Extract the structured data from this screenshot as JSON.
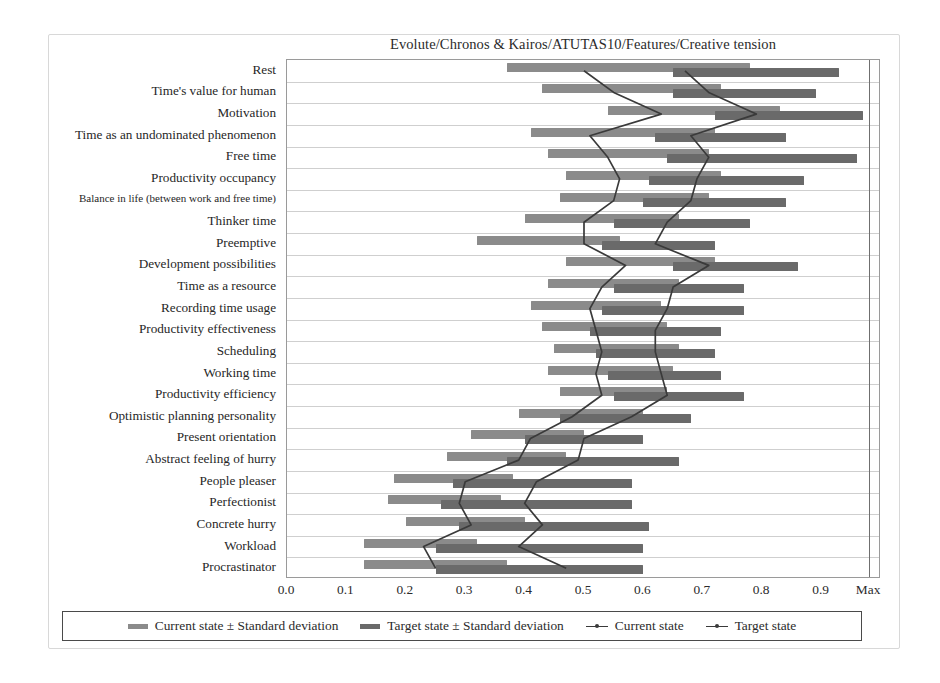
{
  "figure": {
    "title": "Evolute/Chronos & Kairos/ATUTAS10/Features/Creative tension",
    "colors": {
      "current_band": "#8b8b8b",
      "target_band": "#6a6a6a",
      "line": "#3a3a3a",
      "gridline": "#cfcfcf",
      "frame": "#9a9a9a"
    }
  },
  "axis": {
    "x_ticks": [
      "0.0",
      "0.1",
      "0.2",
      "0.3",
      "0.4",
      "0.5",
      "0.6",
      "0.7",
      "0.8",
      "0.9",
      "Max"
    ],
    "x_min": 0.0,
    "x_max": 1.0,
    "max_marker_label": "Max",
    "max_marker_value": 0.98
  },
  "legend": {
    "items": [
      {
        "label": "Current state ± Standard deviation",
        "marker": "band-light"
      },
      {
        "label": "Target state ± Standard deviation",
        "marker": "band-dark"
      },
      {
        "label": "Current state",
        "marker": "line-dot"
      },
      {
        "label": "Target state",
        "marker": "line-dot"
      }
    ]
  },
  "chart_data": {
    "type": "bar",
    "title": "Evolute/Chronos & Kairos/ATUTAS10/Features/Creative tension",
    "xlabel": "",
    "ylabel": "",
    "xlim": [
      0.0,
      1.0
    ],
    "grid": true,
    "legend_position": "bottom",
    "orientation": "horizontal",
    "categories": [
      "Rest",
      "Time's value for human",
      "Motivation",
      "Time as an undominated phenomenon",
      "Free time",
      "Productivity occupancy",
      "Balance in life (between work and free time)",
      "Thinker time",
      "Preemptive",
      "Development possibilities",
      "Time as a resource",
      "Recording time usage",
      "Productivity effectiveness",
      "Scheduling",
      "Working time",
      "Productivity efficiency",
      "Optimistic planning personality",
      "Present orientation",
      "Abstract feeling of hurry",
      "People pleaser",
      "Perfectionist",
      "Concrete hurry",
      "Workload",
      "Procrastinator"
    ],
    "series": [
      {
        "name": "Current state ± Standard deviation",
        "type": "band",
        "low": [
          0.37,
          0.43,
          0.54,
          0.41,
          0.44,
          0.47,
          0.46,
          0.4,
          0.32,
          0.47,
          0.44,
          0.41,
          0.43,
          0.45,
          0.44,
          0.46,
          0.39,
          0.31,
          0.27,
          0.18,
          0.17,
          0.2,
          0.13,
          0.13
        ],
        "high": [
          0.78,
          0.73,
          0.83,
          0.72,
          0.71,
          0.73,
          0.71,
          0.66,
          0.56,
          0.72,
          0.66,
          0.63,
          0.64,
          0.66,
          0.65,
          0.64,
          0.6,
          0.5,
          0.47,
          0.38,
          0.36,
          0.4,
          0.32,
          0.37
        ]
      },
      {
        "name": "Target state ± Standard deviation",
        "type": "band",
        "low": [
          0.65,
          0.65,
          0.72,
          0.62,
          0.64,
          0.61,
          0.6,
          0.55,
          0.53,
          0.65,
          0.55,
          0.53,
          0.51,
          0.52,
          0.54,
          0.55,
          0.46,
          0.4,
          0.37,
          0.28,
          0.26,
          0.29,
          0.25,
          0.25
        ],
        "high": [
          0.93,
          0.89,
          0.97,
          0.84,
          0.96,
          0.87,
          0.84,
          0.78,
          0.72,
          0.86,
          0.77,
          0.77,
          0.73,
          0.72,
          0.73,
          0.77,
          0.68,
          0.6,
          0.66,
          0.58,
          0.58,
          0.61,
          0.6,
          0.6
        ]
      },
      {
        "name": "Current state",
        "type": "line",
        "values": [
          0.5,
          0.55,
          0.63,
          0.51,
          0.54,
          0.56,
          0.55,
          0.5,
          0.5,
          0.57,
          0.53,
          0.51,
          0.52,
          0.53,
          0.52,
          0.53,
          0.48,
          0.41,
          0.39,
          0.3,
          0.29,
          0.31,
          0.23,
          0.25
        ]
      },
      {
        "name": "Target state",
        "type": "line",
        "values": [
          0.67,
          0.71,
          0.79,
          0.68,
          0.71,
          0.69,
          0.68,
          0.64,
          0.62,
          0.71,
          0.65,
          0.64,
          0.62,
          0.62,
          0.63,
          0.64,
          0.58,
          0.5,
          0.49,
          0.42,
          0.4,
          0.43,
          0.39,
          0.47
        ]
      }
    ]
  }
}
